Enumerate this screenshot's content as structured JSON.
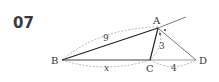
{
  "problem": {
    "number": "07"
  },
  "diagram": {
    "points": {
      "A": "A",
      "B": "B",
      "C": "C",
      "D": "D"
    },
    "lengths": {
      "BA": "9",
      "AC": "3",
      "BC": "x",
      "CD": "4"
    },
    "colors": {
      "stroke": "#333333",
      "dashed": "#999999"
    }
  }
}
